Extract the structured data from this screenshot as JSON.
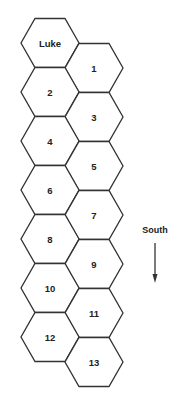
{
  "diagram": {
    "type": "hex-grid",
    "hexes": [
      {
        "label": "Luke",
        "cx": 50,
        "cy": 43
      },
      {
        "label": "1",
        "cx": 94,
        "cy": 68
      },
      {
        "label": "2",
        "cx": 50,
        "cy": 92
      },
      {
        "label": "3",
        "cx": 94,
        "cy": 117
      },
      {
        "label": "4",
        "cx": 50,
        "cy": 141
      },
      {
        "label": "5",
        "cx": 94,
        "cy": 166
      },
      {
        "label": "6",
        "cx": 50,
        "cy": 190
      },
      {
        "label": "7",
        "cx": 94,
        "cy": 215
      },
      {
        "label": "8",
        "cx": 50,
        "cy": 239
      },
      {
        "label": "9",
        "cx": 94,
        "cy": 264
      },
      {
        "label": "10",
        "cx": 50,
        "cy": 288
      },
      {
        "label": "11",
        "cx": 94,
        "cy": 313
      },
      {
        "label": "12",
        "cx": 50,
        "cy": 337
      },
      {
        "label": "13",
        "cx": 94,
        "cy": 362
      }
    ],
    "direction": {
      "label": "South",
      "arrow": "down"
    }
  },
  "colors": {
    "stroke": "#333333",
    "text": "#222222",
    "background": "#ffffff"
  }
}
